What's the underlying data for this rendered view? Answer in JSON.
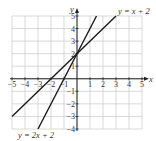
{
  "chart_data": {
    "type": "line",
    "title": "",
    "xlabel": "x",
    "ylabel": "y",
    "xlim": [
      -5,
      5
    ],
    "ylim": [
      -4,
      5
    ],
    "grid": true,
    "x_ticks": [
      -5,
      -4,
      -3,
      -2,
      -1,
      1,
      2,
      3,
      4,
      5
    ],
    "y_ticks": [
      -4,
      -3,
      -2,
      -1,
      1,
      2,
      3,
      4,
      5
    ],
    "x_tick_labels": [
      "−5",
      "−4",
      "−3",
      "−2",
      "−1",
      "1",
      "2",
      "3",
      "4",
      "5"
    ],
    "y_tick_labels": [
      "−4",
      "−3",
      "−2",
      "−1",
      "1",
      "2",
      "3",
      "4",
      "5"
    ],
    "series": [
      {
        "name": "y = x + 2",
        "slope": 1,
        "intercept": 2,
        "x": [
          -5,
          3
        ],
        "y": [
          -3,
          5
        ],
        "label_position": "top-right"
      },
      {
        "name": "y = 2x + 2",
        "slope": 2,
        "intercept": 2,
        "x": [
          -3,
          1.5
        ],
        "y": [
          -4,
          5
        ],
        "label_position": "bottom-left"
      }
    ],
    "line_color": "#1a1a1a",
    "grid_color": "#c8c8c8"
  }
}
